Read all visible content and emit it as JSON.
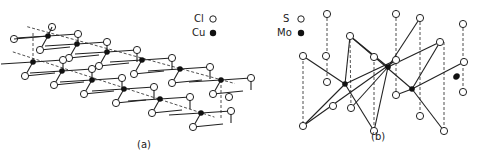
{
  "figure": {
    "panel_a": {
      "label": "(a)",
      "legend": [
        {
          "symbol": "open-circle",
          "text": "Cl"
        },
        {
          "symbol": "filled-circle",
          "text": "Cu"
        }
      ],
      "description": "CuCl2 chain structure"
    },
    "panel_b": {
      "label": "(b)",
      "legend": [
        {
          "symbol": "open-circle",
          "text": "S"
        },
        {
          "symbol": "filled-circle",
          "text": "Mo"
        }
      ],
      "description": "MoS2 trigonal prismatic layer"
    },
    "colors": {
      "line": "#222222",
      "atom_fill_open": "#ffffff",
      "atom_fill_solid": "#111111"
    }
  }
}
